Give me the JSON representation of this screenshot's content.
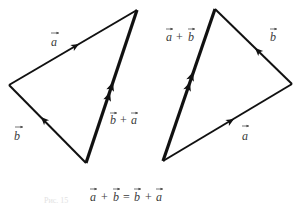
{
  "figure": {
    "left_triangle": {
      "labels": {
        "a": "a",
        "b": "b",
        "sum_first": "b",
        "plus": "+",
        "sum_second": "a"
      },
      "edges": [
        {
          "name": "vector-a",
          "from": "left",
          "to": "top",
          "arrows": 1,
          "weight": "normal"
        },
        {
          "name": "vector-b",
          "from": "bottom",
          "to": "left",
          "arrows": 1,
          "weight": "normal"
        },
        {
          "name": "vector-b-plus-a",
          "from": "bottom",
          "to": "top",
          "arrows": 2,
          "weight": "bold"
        }
      ]
    },
    "right_triangle": {
      "labels": {
        "a": "a",
        "b": "b",
        "sum_first": "a",
        "plus": "+",
        "sum_second": "b"
      },
      "edges": [
        {
          "name": "vector-a",
          "from": "bottom-left",
          "to": "right",
          "arrows": 1,
          "weight": "normal"
        },
        {
          "name": "vector-b",
          "from": "right",
          "to": "top",
          "arrows": 1,
          "weight": "normal"
        },
        {
          "name": "vector-a-plus-b",
          "from": "bottom-left",
          "to": "top",
          "arrows": 2,
          "weight": "bold"
        }
      ]
    },
    "equation": {
      "t1": "a",
      "plus1": "+",
      "t2": "b",
      "equals": "=",
      "t3": "b",
      "plus2": "+",
      "t4": "a"
    },
    "caption_faint": "Рис. 15"
  }
}
